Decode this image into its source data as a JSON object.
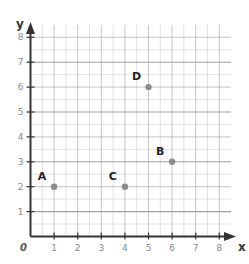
{
  "chart_data": {
    "type": "scatter",
    "title": "",
    "xlabel": "x",
    "ylabel": "y",
    "origin_label": "0",
    "xlim": [
      0,
      8
    ],
    "ylim": [
      0,
      8
    ],
    "grid": true,
    "minor_grid_step": 0.5,
    "x_ticks": [
      "1",
      "2",
      "3",
      "4",
      "5",
      "6",
      "7",
      "8"
    ],
    "y_ticks": [
      "1",
      "2",
      "3",
      "4",
      "5",
      "6",
      "7",
      "8"
    ],
    "points": [
      {
        "label": "A",
        "x": 1,
        "y": 2
      },
      {
        "label": "B",
        "x": 6,
        "y": 3
      },
      {
        "label": "C",
        "x": 4,
        "y": 2
      },
      {
        "label": "D",
        "x": 5,
        "y": 6
      }
    ],
    "colors": {
      "point": "#8c8c8c",
      "axis": "#333333",
      "major_grid": "#9a9a9a",
      "minor_grid": "#e2e2e2"
    }
  }
}
